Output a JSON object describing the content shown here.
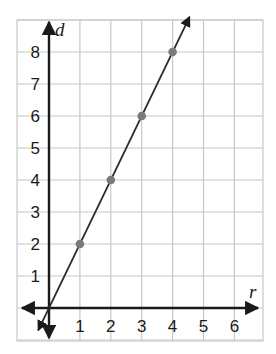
{
  "chart_data": {
    "type": "line",
    "title": "",
    "xlabel": "r",
    "ylabel": "d",
    "x_ticks": [
      "1",
      "2",
      "3",
      "4",
      "5",
      "6"
    ],
    "y_ticks": [
      "1",
      "2",
      "3",
      "4",
      "5",
      "6",
      "7",
      "8"
    ],
    "xlim": [
      -1,
      7
    ],
    "ylim": [
      -1,
      9
    ],
    "grid": true,
    "legend": null,
    "series": [
      {
        "name": "d = 2r",
        "line": {
          "from": [
            -0.35,
            -0.7
          ],
          "to": [
            4.55,
            9.1
          ],
          "arrows": "both"
        },
        "points": [
          {
            "x": 1,
            "y": 2
          },
          {
            "x": 2,
            "y": 4
          },
          {
            "x": 3,
            "y": 6
          },
          {
            "x": 4,
            "y": 8
          }
        ]
      }
    ],
    "colors": {
      "grid": "#c8c8c8",
      "axis": "#1a1a1a",
      "line": "#2a2a2a",
      "point": "#7a7a7a"
    }
  }
}
